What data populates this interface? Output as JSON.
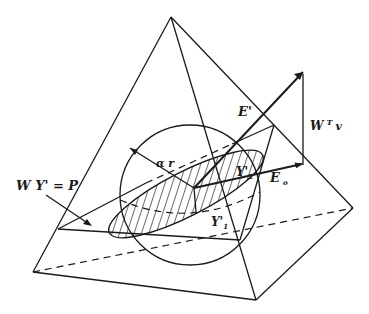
{
  "diagram": {
    "colors": {
      "ink": "#1a1a1a",
      "background": "#ffffff"
    },
    "labels": {
      "plane": "W Y' = P",
      "radius": "α r",
      "e_prime": "E'",
      "w_t_v": "W",
      "w_t_v_sup": "T",
      "w_t_v_var": "v",
      "e_o": "E",
      "e_o_sub": "o",
      "y2": "Y'",
      "y2_sub": "2",
      "y1": "Y'",
      "y1_sub": "1"
    }
  }
}
